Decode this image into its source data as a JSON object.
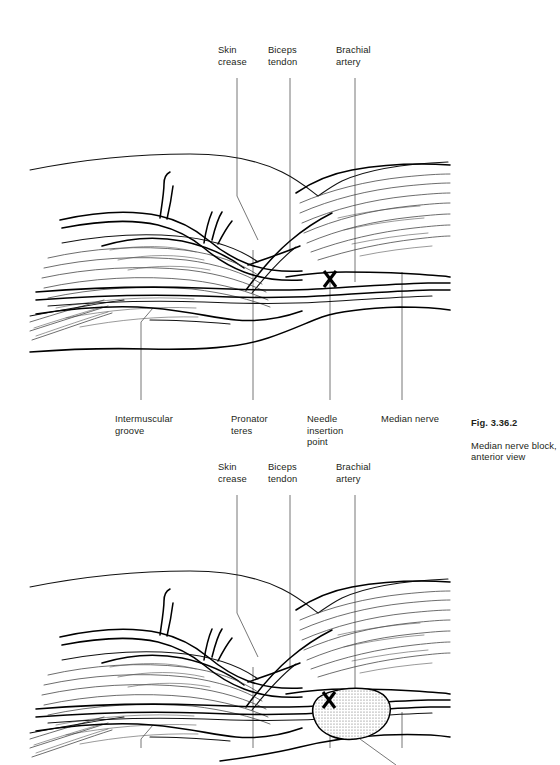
{
  "figure_1": {
    "labels_top": [
      {
        "text": "Skin\ncrease",
        "x": 218,
        "y": 44
      },
      {
        "text": "Biceps\ntendon",
        "x": 268,
        "y": 44
      },
      {
        "text": "Brachial\nartery",
        "x": 336,
        "y": 44
      }
    ],
    "labels_bottom": [
      {
        "text": "Intermuscular\ngroove",
        "x": 115,
        "y": 413
      },
      {
        "text": "Pronator\nteres",
        "x": 231,
        "y": 413
      },
      {
        "text": "Needle\ninsertion\npoint",
        "x": 307,
        "y": 413
      },
      {
        "text": "Median nerve",
        "x": 381,
        "y": 413
      }
    ],
    "marker": "needle-insertion-x"
  },
  "caption": {
    "title": "Fig. 3.36.2",
    "body": "Median nerve block,\nanterior view",
    "x": 471,
    "y": 405
  },
  "figure_2": {
    "labels_top": [
      {
        "text": "Skin\ncrease",
        "x": 218,
        "y": 461
      },
      {
        "text": "Biceps\ntendon",
        "x": 268,
        "y": 461
      },
      {
        "text": "Brachial\nartery",
        "x": 336,
        "y": 461
      }
    ],
    "marker": "needle-insertion-x",
    "depot": "local-anesthetic-depot"
  },
  "colors": {
    "ink": "#000000",
    "text": "#231f20",
    "leader": "#4a4a4a",
    "background": "#ffffff",
    "depot_stipple": "#6b6b6b"
  }
}
